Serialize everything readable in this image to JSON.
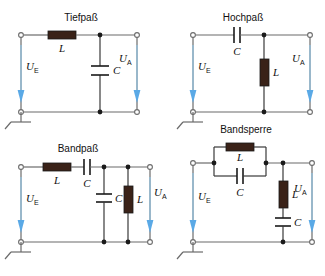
{
  "figure": {
    "kind": "electrical-filter-schematics",
    "background_color": "#ffffff",
    "wire_color": "#6b6b6b",
    "node_color": "#1a1a1a",
    "component_fill": "#3a2218",
    "arrow_color": "#5aa9e6",
    "text_color": "#111111"
  },
  "circuits": [
    {
      "id": "tiefpass",
      "title": "Tiefpaß",
      "input_label": {
        "symbol": "U",
        "subscript": "E"
      },
      "output_label": {
        "symbol": "U",
        "subscript": "A"
      },
      "series_components": [
        {
          "type": "inductor",
          "label": "L"
        }
      ],
      "shunt_components": [
        {
          "type": "capacitor",
          "label": "C"
        }
      ],
      "ground": true
    },
    {
      "id": "hochpass",
      "title": "Hochpaß",
      "input_label": {
        "symbol": "U",
        "subscript": "E"
      },
      "output_label": {
        "symbol": "U",
        "subscript": "A"
      },
      "series_components": [
        {
          "type": "capacitor",
          "label": "C"
        }
      ],
      "shunt_components": [
        {
          "type": "inductor",
          "label": "L"
        }
      ],
      "ground": true
    },
    {
      "id": "bandpass",
      "title": "Bandpaß",
      "input_label": {
        "symbol": "U",
        "subscript": "E"
      },
      "output_label": {
        "symbol": "U",
        "subscript": "A"
      },
      "series_components": [
        {
          "type": "inductor",
          "label": "L"
        },
        {
          "type": "capacitor",
          "label": "C"
        }
      ],
      "shunt_components": [
        {
          "type": "capacitor",
          "label": "C"
        },
        {
          "type": "inductor",
          "label": "L"
        }
      ],
      "ground": true
    },
    {
      "id": "bandsperre",
      "title": "Bandsperre",
      "input_label": {
        "symbol": "U",
        "subscript": "E"
      },
      "output_label": {
        "symbol": "U",
        "subscript": "A"
      },
      "series_components": [
        {
          "type": "parallel-lc",
          "inductor_label": "L",
          "capacitor_label": "C"
        }
      ],
      "shunt_components": [
        {
          "type": "inductor",
          "label": "L"
        },
        {
          "type": "capacitor",
          "label": "C"
        }
      ],
      "ground": true
    }
  ]
}
